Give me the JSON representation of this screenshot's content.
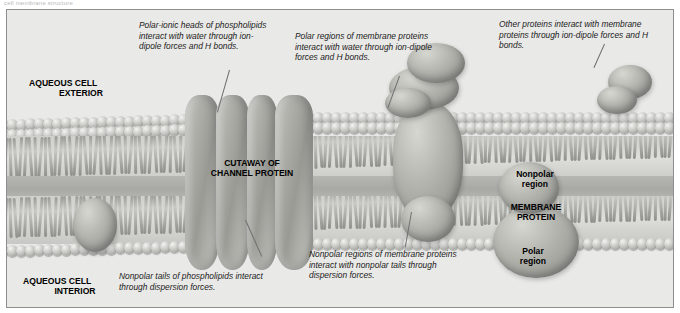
{
  "figure": {
    "title_sliver": "cell membrane structure",
    "background_color": "#e9e9e7",
    "border_color": "#8e8e8e"
  },
  "captions": [
    {
      "id": "phospholipid-heads",
      "text": "Polar-ionic heads of phospholipids interact with water through ion-dipole forces and H bonds."
    },
    {
      "id": "polar-regions-proteins",
      "text": "Polar regions of membrane proteins interact with water through ion-dipole forces and H bonds."
    },
    {
      "id": "other-proteins",
      "text": "Other proteins interact with membrane proteins through ion-dipole forces and H bonds."
    },
    {
      "id": "nonpolar-regions-proteins",
      "text": "Nonpolar regions of membrane proteins interact with nonpolar tails through dispersion forces."
    },
    {
      "id": "nonpolar-tails",
      "text": "Nonpolar tails of phospholipids interact through dispersion forces."
    }
  ],
  "labels": {
    "aqueous_exterior_line1": "AQUEOUS CELL",
    "aqueous_exterior_line2": "EXTERIOR",
    "aqueous_interior_line1": "AQUEOUS CELL",
    "aqueous_interior_line2": "INTERIOR",
    "cutaway_line1": "CUTAWAY OF",
    "cutaway_line2": "CHANNEL PROTEIN",
    "nonpolar_region_line1": "Nonpolar",
    "nonpolar_region_line2": "region",
    "membrane_protein_line1": "MEMBRANE",
    "membrane_protein_line2": "PROTEIN",
    "polar_region_line1": "Polar",
    "polar_region_line2": "region"
  }
}
